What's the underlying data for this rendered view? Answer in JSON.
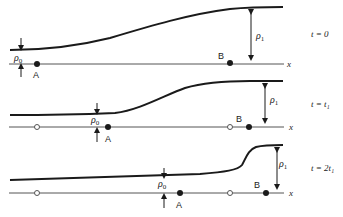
{
  "figure": {
    "axis_label": "x",
    "panels": [
      {
        "time_label": "t = 0",
        "point_a_label": "A",
        "point_b_label": "B",
        "rho0_label": "ρ",
        "rho0_sub": "0",
        "rho1_label": "ρ",
        "rho1_sub": "1"
      },
      {
        "time_label": "t = t₁",
        "point_a_label": "A",
        "point_b_label": "B",
        "rho0_label": "ρ",
        "rho0_sub": "0",
        "rho1_label": "ρ",
        "rho1_sub": "1"
      },
      {
        "time_label": "t = 2t₁",
        "point_a_label": "A",
        "point_b_label": "B",
        "rho0_label": "ρ",
        "rho0_sub": "0",
        "rho1_label": "ρ",
        "rho1_sub": "1"
      }
    ],
    "colors": {
      "ink": "#1a1a1a",
      "axis": "#555555",
      "background": "#ffffff"
    }
  }
}
